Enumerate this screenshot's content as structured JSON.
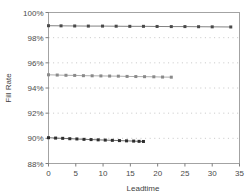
{
  "chart_data": {
    "type": "line",
    "title": "",
    "subtitle": "",
    "xlabel": "Leadtime",
    "ylabel": "Fill Rate",
    "xlim": [
      0,
      35
    ],
    "ylim": [
      88,
      100
    ],
    "xticks": [
      0,
      5,
      10,
      15,
      20,
      25,
      30,
      35
    ],
    "xtick_labels": [
      "0",
      "5",
      "10",
      "15",
      "20",
      "25",
      "30",
      "35"
    ],
    "yticks": [
      88,
      90,
      92,
      94,
      96,
      98,
      100
    ],
    "ytick_labels": [
      "88%",
      "90%",
      "92%",
      "94%",
      "96%",
      "98%",
      "100%"
    ],
    "grid": "horizontal-dotted",
    "legend": "none",
    "marker": "square",
    "series": [
      {
        "name": "series-top",
        "color": "#4a4a4a",
        "points": [
          {
            "x": 0.0,
            "y": 98.95
          },
          {
            "x": 2.3,
            "y": 98.94
          },
          {
            "x": 4.8,
            "y": 98.93
          },
          {
            "x": 7.3,
            "y": 98.92
          },
          {
            "x": 9.9,
            "y": 98.92
          },
          {
            "x": 12.4,
            "y": 98.91
          },
          {
            "x": 14.9,
            "y": 98.9
          },
          {
            "x": 17.4,
            "y": 98.9
          },
          {
            "x": 19.9,
            "y": 98.89
          },
          {
            "x": 22.5,
            "y": 98.88
          },
          {
            "x": 25.0,
            "y": 98.88
          },
          {
            "x": 27.5,
            "y": 98.87
          },
          {
            "x": 30.0,
            "y": 98.86
          },
          {
            "x": 33.4,
            "y": 98.85
          }
        ]
      },
      {
        "name": "series-middle",
        "color": "#8a8a8a",
        "points": [
          {
            "x": 0.0,
            "y": 95.05
          },
          {
            "x": 1.6,
            "y": 95.03
          },
          {
            "x": 3.2,
            "y": 95.01
          },
          {
            "x": 4.8,
            "y": 95.0
          },
          {
            "x": 6.4,
            "y": 94.98
          },
          {
            "x": 8.0,
            "y": 94.97
          },
          {
            "x": 9.6,
            "y": 94.96
          },
          {
            "x": 11.2,
            "y": 94.95
          },
          {
            "x": 12.8,
            "y": 94.94
          },
          {
            "x": 14.4,
            "y": 94.92
          },
          {
            "x": 16.0,
            "y": 94.91
          },
          {
            "x": 17.6,
            "y": 94.9
          },
          {
            "x": 19.3,
            "y": 94.89
          },
          {
            "x": 20.9,
            "y": 94.87
          },
          {
            "x": 22.5,
            "y": 94.86
          }
        ]
      },
      {
        "name": "series-bottom",
        "color": "#2e2e2e",
        "points": [
          {
            "x": 0.0,
            "y": 90.05
          },
          {
            "x": 1.3,
            "y": 90.02
          },
          {
            "x": 2.6,
            "y": 90.0
          },
          {
            "x": 3.9,
            "y": 89.97
          },
          {
            "x": 5.2,
            "y": 89.95
          },
          {
            "x": 6.5,
            "y": 89.92
          },
          {
            "x": 7.8,
            "y": 89.9
          },
          {
            "x": 9.1,
            "y": 89.88
          },
          {
            "x": 10.4,
            "y": 89.86
          },
          {
            "x": 11.7,
            "y": 89.84
          },
          {
            "x": 13.0,
            "y": 89.82
          },
          {
            "x": 14.3,
            "y": 89.8
          },
          {
            "x": 15.6,
            "y": 89.78
          },
          {
            "x": 16.6,
            "y": 89.76
          },
          {
            "x": 17.4,
            "y": 89.75
          }
        ]
      }
    ]
  }
}
